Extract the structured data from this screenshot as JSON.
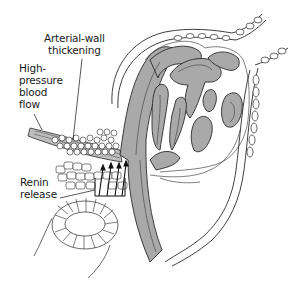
{
  "diagram": {
    "labels": [
      {
        "id": "arterial-wall-thickening",
        "lines": [
          "Arterial-wall",
          "thickening"
        ]
      },
      {
        "id": "high-pressure-blood-flow",
        "lines": [
          "High-",
          "pressure",
          "blood",
          "flow"
        ]
      },
      {
        "id": "renin-release",
        "lines": [
          "Renin",
          "release"
        ]
      }
    ],
    "colors": {
      "capillary_fill": "#a9a9a9",
      "outline": "#2a2a2a",
      "background": "#ffffff",
      "text": "#1a1a1a"
    }
  }
}
